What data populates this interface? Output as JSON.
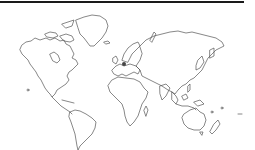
{
  "map": {
    "style": "outline world map",
    "stroke_color": "#555555",
    "background_color": "#ffffff",
    "header_rule_color": "#1a1a1a",
    "regions": [
      "north-america",
      "greenland",
      "canadian-arctic-islands",
      "south-america",
      "europe",
      "africa",
      "asia",
      "australia",
      "new-zealand",
      "pacific-islands"
    ],
    "markers": [
      {
        "name": "europe-marker",
        "x": 124,
        "y": 64,
        "color": "#444444"
      }
    ]
  }
}
